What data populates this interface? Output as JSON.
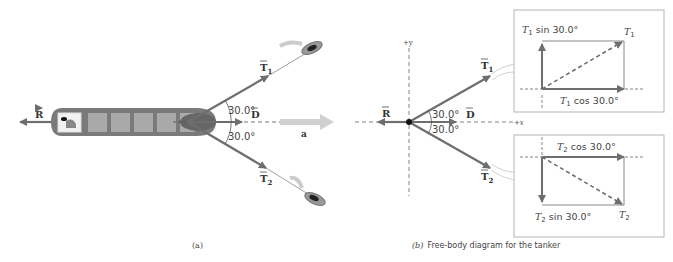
{
  "panel_a": {
    "caption": "(a)",
    "labels": {
      "R": "R",
      "T1": "T",
      "T1_sub": "1",
      "T2": "T",
      "T2_sub": "2",
      "D": "D",
      "a": "a",
      "angle_top": "30.0°",
      "angle_bottom": "30.0°"
    }
  },
  "panel_b": {
    "caption_prefix": "(b)",
    "caption_text": "Free-body diagram for the tanker",
    "axes": {
      "plus_y": "+y",
      "plus_x": "+x"
    },
    "labels": {
      "R": "R",
      "T1": "T",
      "T1_sub": "1",
      "T2": "T",
      "T2_sub": "2",
      "D": "D",
      "angle_top": "30.0°",
      "angle_bottom": "30.0°"
    },
    "inset_top": {
      "vertical_label_T": "T",
      "vertical_label_sub": "1",
      "vertical_label_rest": " sin 30.0°",
      "horizontal_label_T": "T",
      "horizontal_label_sub": "1",
      "horizontal_label_rest": " cos 30.0°",
      "corner_T": "T",
      "corner_sub": "1"
    },
    "inset_bottom": {
      "horizontal_label_T": "T",
      "horizontal_label_sub": "2",
      "horizontal_label_rest": " cos 30.0°",
      "vertical_label_T": "T",
      "vertical_label_sub": "2",
      "vertical_label_rest": " sin 30.0°",
      "corner_T": "T",
      "corner_sub": "2"
    }
  },
  "colors": {
    "vector": "#6e6e6e",
    "ship_hull": "#7a7a7a",
    "ship_hold": "#a9a9a9",
    "accel": "#c8c8c8",
    "inset_border": "#b5b5b5"
  }
}
